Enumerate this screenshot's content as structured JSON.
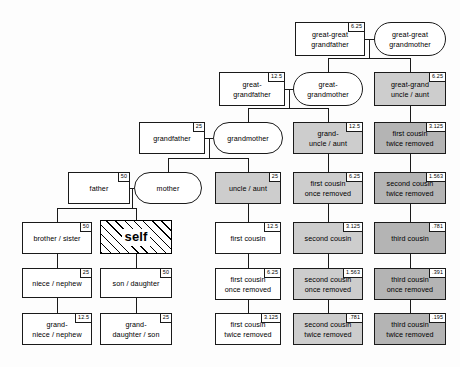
{
  "diagram": {
    "unit": "percent",
    "colors": {
      "line": "#1a1a1a",
      "background": "#fdfdfd",
      "shade_0": "#ffffff",
      "shade_1": "#cdcdcd",
      "shade_2": "#b4b4b4",
      "shade_3": "#9b9b9b"
    }
  },
  "nodes": [
    {
      "id": "great-great-grandfather",
      "label": "great-great\ngrandfather",
      "pct": "6.25",
      "shape": "rect",
      "shade": 0,
      "x": 295,
      "y": 22,
      "w": 70,
      "h": 34
    },
    {
      "id": "great-great-grandmother",
      "label": "great-great\ngrandmother",
      "pct": "",
      "shape": "round",
      "shade": 0,
      "x": 374,
      "y": 22,
      "w": 72,
      "h": 34
    },
    {
      "id": "great-grandfather",
      "label": "great-\ngrandfather",
      "pct": "12.5",
      "shape": "rect",
      "shade": 0,
      "x": 219,
      "y": 72,
      "w": 66,
      "h": 34
    },
    {
      "id": "great-grandmother",
      "label": "great-\ngrandmother",
      "pct": "",
      "shape": "round",
      "shade": 0,
      "x": 293,
      "y": 72,
      "w": 70,
      "h": 34
    },
    {
      "id": "great-grand-uncle-aunt",
      "label": "great-grand\nuncle / aunt",
      "pct": "6.25",
      "shape": "rect",
      "shade": 1,
      "x": 374,
      "y": 72,
      "w": 72,
      "h": 34
    },
    {
      "id": "grandfather",
      "label": "grandfather",
      "pct": "25",
      "shape": "rect",
      "shade": 0,
      "x": 139,
      "y": 122,
      "w": 66,
      "h": 32
    },
    {
      "id": "grandmother",
      "label": "grandmother",
      "pct": "",
      "shape": "round",
      "shade": 0,
      "x": 213,
      "y": 122,
      "w": 70,
      "h": 32
    },
    {
      "id": "grand-uncle-aunt",
      "label": "grand-\nuncle / aunt",
      "pct": "12.5",
      "shape": "rect",
      "shade": 1,
      "x": 293,
      "y": 122,
      "w": 70,
      "h": 32
    },
    {
      "id": "first-cousin-twice-removed-a",
      "label": "first cousin\ntwice removed",
      "pct": "3.125",
      "shape": "rect",
      "shade": 2,
      "x": 374,
      "y": 122,
      "w": 72,
      "h": 32
    },
    {
      "id": "father",
      "label": "father",
      "pct": "50",
      "shape": "rect",
      "shade": 0,
      "x": 68,
      "y": 172,
      "w": 62,
      "h": 32
    },
    {
      "id": "mother",
      "label": "mother",
      "pct": "",
      "shape": "round",
      "shade": 0,
      "x": 134,
      "y": 172,
      "w": 68,
      "h": 32
    },
    {
      "id": "uncle-aunt",
      "label": "uncle / aunt",
      "pct": "25",
      "shape": "rect",
      "shade": 1,
      "x": 215,
      "y": 172,
      "w": 66,
      "h": 32
    },
    {
      "id": "first-cousin-once-removed-a",
      "label": "first cousin\nonce removed",
      "pct": "6.25",
      "shape": "rect",
      "shade": 1,
      "x": 293,
      "y": 172,
      "w": 70,
      "h": 32
    },
    {
      "id": "second-cousin-twice-removed-a",
      "label": "second cousin\ntwice removed",
      "pct": "1.563",
      "shape": "rect",
      "shade": 2,
      "x": 374,
      "y": 172,
      "w": 72,
      "h": 32
    },
    {
      "id": "brother-sister",
      "label": "brother / sister",
      "pct": "50",
      "shape": "rect",
      "shade": 0,
      "x": 22,
      "y": 222,
      "w": 70,
      "h": 32
    },
    {
      "id": "self",
      "label": "self",
      "pct": "",
      "shape": "rect",
      "shade": 0,
      "x": 100,
      "y": 220,
      "w": 72,
      "h": 34
    },
    {
      "id": "first-cousin",
      "label": "first cousin",
      "pct": "12.5",
      "shape": "rect",
      "shade": 0,
      "x": 215,
      "y": 222,
      "w": 66,
      "h": 32
    },
    {
      "id": "second-cousin",
      "label": "second cousin",
      "pct": "3.125",
      "shape": "rect",
      "shade": 1,
      "x": 293,
      "y": 222,
      "w": 70,
      "h": 32
    },
    {
      "id": "third-cousin",
      "label": "third cousin",
      "pct": ".781",
      "shape": "rect",
      "shade": 2,
      "x": 374,
      "y": 222,
      "w": 72,
      "h": 32
    },
    {
      "id": "niece-nephew",
      "label": "niece / nephew",
      "pct": "25",
      "shape": "rect",
      "shade": 0,
      "x": 22,
      "y": 268,
      "w": 70,
      "h": 30
    },
    {
      "id": "son-daughter",
      "label": "son / daughter",
      "pct": "50",
      "shape": "rect",
      "shade": 0,
      "x": 100,
      "y": 268,
      "w": 72,
      "h": 30
    },
    {
      "id": "first-cousin-once-removed-b",
      "label": "first cousin\nonce removed",
      "pct": "6.25",
      "shape": "rect",
      "shade": 0,
      "x": 215,
      "y": 268,
      "w": 66,
      "h": 32
    },
    {
      "id": "second-cousin-once-removed",
      "label": "second cousin\nonce removed",
      "pct": "1.563",
      "shape": "rect",
      "shade": 1,
      "x": 293,
      "y": 268,
      "w": 70,
      "h": 32
    },
    {
      "id": "third-cousin-once-removed",
      "label": "third cousin\nonce removed",
      "pct": ".391",
      "shape": "rect",
      "shade": 2,
      "x": 374,
      "y": 268,
      "w": 72,
      "h": 32
    },
    {
      "id": "grand-niece-nephew",
      "label": "grand-\nniece / nephew",
      "pct": "12.5",
      "shape": "rect",
      "shade": 0,
      "x": 22,
      "y": 313,
      "w": 70,
      "h": 32
    },
    {
      "id": "grand-daughter-son",
      "label": "grand-\ndaughter / son",
      "pct": "25",
      "shape": "rect",
      "shade": 0,
      "x": 100,
      "y": 313,
      "w": 72,
      "h": 32
    },
    {
      "id": "first-cousin-twice-removed-b",
      "label": "first cousin\ntwice removed",
      "pct": "3.125",
      "shape": "rect",
      "shade": 0,
      "x": 215,
      "y": 313,
      "w": 66,
      "h": 32
    },
    {
      "id": "second-cousin-twice-removed-b",
      "label": "second cousin\ntwice removed",
      "pct": ".781",
      "shape": "rect",
      "shade": 1,
      "x": 293,
      "y": 313,
      "w": 70,
      "h": 32
    },
    {
      "id": "third-cousin-twice-removed",
      "label": "third cousin\ntwice removed",
      "pct": ".195",
      "shape": "rect",
      "shade": 2,
      "x": 374,
      "y": 313,
      "w": 72,
      "h": 32
    }
  ]
}
